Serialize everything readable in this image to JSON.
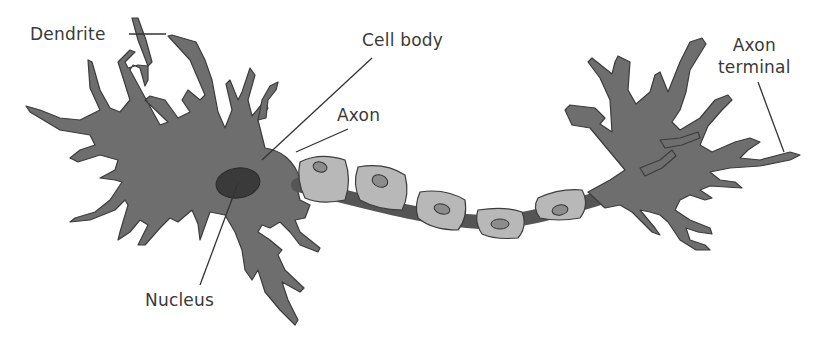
{
  "diagram": {
    "labels": {
      "dendrite": "Dendrite",
      "cell_body": "Cell body",
      "axon": "Axon",
      "axon_terminal_line1": "Axon",
      "axon_terminal_line2": "terminal",
      "nucleus": "Nucleus"
    },
    "colors": {
      "background": "#ffffff",
      "neuron_fill": "#6e6e6e",
      "neuron_outline": "#3c3c3c",
      "nucleus_fill": "#3a3a3a",
      "myelin_fill": "#b8b8b8",
      "schwann_nucleus_fill": "#8c8c8c",
      "leader_line": "#333333",
      "label_text": "#3a3a3a"
    },
    "myelin_sheath_segments": 6
  }
}
